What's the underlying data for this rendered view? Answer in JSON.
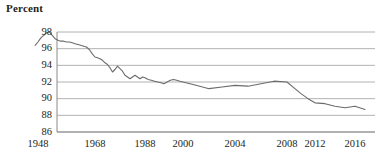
{
  "chart_data": {
    "type": "line",
    "title": "",
    "subtitle": "",
    "xlabel": "",
    "ylabel": "Percent",
    "ylim": [
      86,
      98
    ],
    "xlim": [
      1947,
      2017
    ],
    "grid": true,
    "legend": null,
    "y_ticks": [
      98,
      96,
      94,
      92,
      90,
      88,
      86
    ],
    "x_ticks": [
      1948,
      1968,
      1988,
      2000,
      2004,
      2008,
      2012,
      2016
    ],
    "x_tick_positions_px": [
      38,
      95,
      145,
      183,
      235,
      287,
      315,
      355
    ],
    "series": [
      {
        "name": "Percent",
        "x": [
          1947,
          1948,
          1949,
          1950,
          1951,
          1952,
          1953,
          1954,
          1955,
          1956,
          1957,
          1958,
          1959,
          1960,
          1961,
          1962,
          1963,
          1964,
          1965,
          1966,
          1967,
          1968,
          1969,
          1970,
          1971,
          1972,
          1973,
          1974,
          1975,
          1976,
          1977,
          1978,
          1979,
          1980,
          1981,
          1982,
          1983,
          1984,
          1985,
          1986,
          1987,
          1988,
          1989,
          1990,
          1991,
          1992,
          1993,
          1994,
          1995,
          1996,
          1997,
          1998,
          1999,
          2000,
          2001,
          2002,
          2003,
          2004,
          2005,
          2006,
          2007,
          2008,
          2009,
          2010,
          2011,
          2012,
          2013,
          2014,
          2015,
          2016,
          2017
        ],
        "values": [
          96.4,
          96.8,
          97.3,
          97.6,
          97.9,
          98.0,
          97.6,
          97.2,
          97.0,
          96.9,
          96.9,
          96.8,
          96.8,
          96.7,
          96.6,
          96.5,
          96.4,
          96.3,
          96.2,
          95.9,
          95.4,
          95.0,
          94.9,
          94.8,
          94.6,
          94.3,
          94.1,
          93.7,
          93.2,
          93.5,
          93.9,
          93.6,
          93.3,
          92.8,
          92.6,
          92.4,
          92.6,
          92.8,
          92.6,
          92.4,
          92.6,
          92.5,
          92.3,
          92.2,
          92.1,
          92.0,
          91.9,
          91.8,
          92.0,
          92.2,
          92.3,
          92.2,
          92.1,
          92.0,
          91.6,
          91.2,
          91.4,
          91.6,
          91.5,
          91.8,
          92.1,
          92.0,
          91.3,
          90.6,
          90.0,
          89.5,
          89.4,
          89.1,
          88.9,
          89.1,
          88.7
        ]
      }
    ],
    "line_color": "#6b6b6b",
    "grid_color": "#a9a9a9",
    "axis_color": "#8a8a8a"
  },
  "labels": {
    "y_axis_title": "Percent",
    "y_ticks": [
      "98",
      "96",
      "94",
      "92",
      "90",
      "88",
      "86"
    ],
    "x_ticks": [
      "1948",
      "1968",
      "1988",
      "2000",
      "2004",
      "2008",
      "2012",
      "2016"
    ]
  }
}
